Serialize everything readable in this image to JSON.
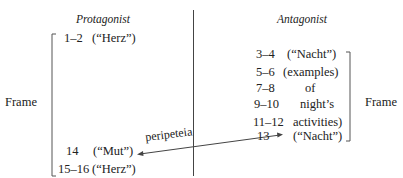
{
  "left": {
    "heading": "Protagonist",
    "rows": [
      {
        "num": "1–2",
        "label": "(“Herz”)"
      },
      {
        "num": "14",
        "label": "(“Mut”)"
      },
      {
        "num": "15–16",
        "label": "(“Herz”)"
      }
    ],
    "frame_label": "Frame"
  },
  "right": {
    "heading": "Antagonist",
    "rows": [
      {
        "num": "3–4",
        "label": "(“Nacht”)"
      },
      {
        "num": "5–6",
        "label": "(examples)"
      },
      {
        "num": "7–8",
        "label": "of"
      },
      {
        "num": "9–10",
        "label": "night’s"
      },
      {
        "num": "11–12",
        "label": "activities)"
      },
      {
        "num": "13",
        "label": "(“Nacht”)"
      }
    ],
    "frame_label": "Frame"
  },
  "arrow": {
    "label": "peripeteia"
  }
}
